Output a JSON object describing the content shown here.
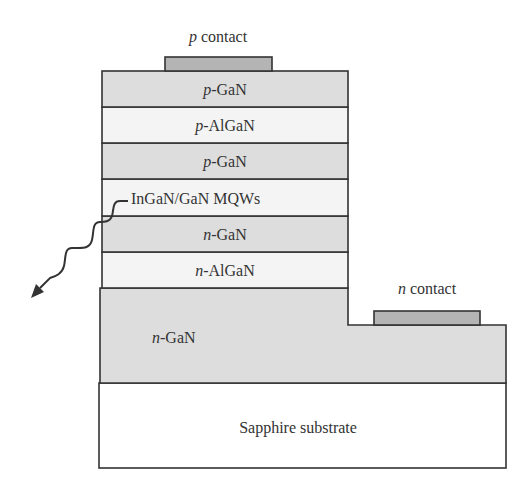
{
  "colors": {
    "dark_layer": "#dddddd",
    "light_layer": "#f4f4f4",
    "contact": "#b4b4b4",
    "substrate": "#ffffff",
    "outline": "#333333"
  },
  "contacts": {
    "p": {
      "prefix": "p",
      "suffix": " contact"
    },
    "n": {
      "prefix": "n",
      "suffix": " contact"
    }
  },
  "layers": [
    {
      "id": "p-gan-top",
      "prefix": "p",
      "suffix": "-GaN",
      "shade": "dark"
    },
    {
      "id": "p-algan",
      "prefix": "p",
      "suffix": "-AlGaN",
      "shade": "light"
    },
    {
      "id": "p-gan",
      "prefix": "p",
      "suffix": "-GaN",
      "shade": "dark"
    },
    {
      "id": "mqw",
      "prefix": "",
      "suffix": "InGaN/GaN MQWs",
      "shade": "light"
    },
    {
      "id": "n-gan-upper",
      "prefix": "n",
      "suffix": "-GaN",
      "shade": "dark"
    },
    {
      "id": "n-algan",
      "prefix": "n",
      "suffix": "-AlGaN",
      "shade": "light"
    },
    {
      "id": "n-gan-base",
      "prefix": "n",
      "suffix": "-GaN",
      "shade": "dark"
    }
  ],
  "substrate": {
    "label": "Sapphire substrate"
  },
  "emission": {
    "icon": "wavy-light-emission-arrow"
  }
}
